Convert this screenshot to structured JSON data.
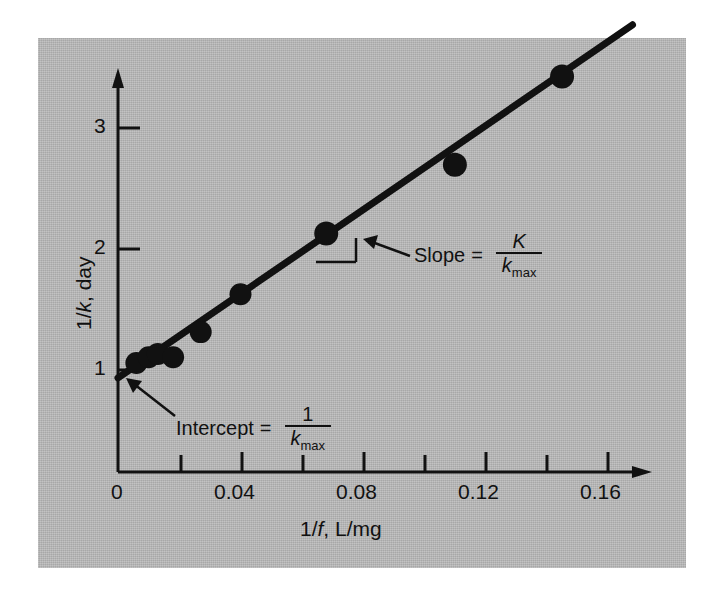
{
  "figure": {
    "background_color": "#ffffff",
    "panel_color": "#b6b6b6",
    "ink_color": "#111111"
  },
  "axes": {
    "x": {
      "title_parts": {
        "prefix": "1/",
        "italic": "f",
        "suffix": ", L/mg"
      },
      "title_plain": "1/f, L/mg",
      "major_ticks": [
        0,
        0.04,
        0.08,
        0.12,
        0.16
      ],
      "major_tick_labels": [
        "0",
        "0.04",
        "0.08",
        "0.12",
        "0.16"
      ],
      "minor_ticks": [
        0.02,
        0.06,
        0.1,
        0.14
      ],
      "range": [
        0,
        0.172
      ]
    },
    "y": {
      "title_parts": {
        "prefix": "1/",
        "italic": "k",
        "suffix": ", day"
      },
      "title_plain": "1/k, day",
      "major_ticks": [
        1,
        2,
        3
      ],
      "major_tick_labels": [
        "1",
        "2",
        "3"
      ],
      "range": [
        0,
        3.75
      ]
    }
  },
  "annotations": {
    "slope": {
      "label": "Slope",
      "equals": "=",
      "numerator": "K",
      "denominator_base": "k",
      "denominator_sub": "max",
      "plain": "Slope = K / k_max"
    },
    "intercept": {
      "label": "Intercept",
      "equals": "=",
      "numerator": "1",
      "denominator_base": "k",
      "denominator_sub": "max",
      "plain": "Intercept = 1 / k_max"
    }
  },
  "chart_data": {
    "type": "scatter",
    "title": "",
    "subtitle": "",
    "xlabel": "1/f, L/mg",
    "ylabel": "1/k, day",
    "xlim": [
      0,
      0.172
    ],
    "ylim": [
      0,
      3.75
    ],
    "grid": false,
    "legend": null,
    "xticks": [
      0,
      0.02,
      0.04,
      0.06,
      0.08,
      0.1,
      0.12,
      0.14,
      0.16
    ],
    "xticklabels": [
      "0",
      "",
      "0.04",
      "",
      "0.08",
      "",
      "0.12",
      "",
      "0.16"
    ],
    "yticks": [
      1,
      2,
      3
    ],
    "yticklabels": [
      "1",
      "2",
      "3"
    ],
    "series": [
      {
        "name": "observations",
        "marker": "filled-circle",
        "marker_color": "#111111",
        "x": [
          0.006,
          0.01,
          0.013,
          0.018,
          0.027,
          0.04,
          0.068,
          0.11,
          0.145
        ],
        "y": [
          0.95,
          1.0,
          1.03,
          1.0,
          1.22,
          1.55,
          2.08,
          2.68,
          3.45
        ]
      },
      {
        "name": "least-squares fit",
        "type": "line",
        "color": "#111111",
        "intercept": 0.82,
        "slope": 18.3,
        "x_start": 0.0,
        "x_end": 0.168,
        "y_start": 0.82,
        "y_end": 3.9
      }
    ],
    "annotations": [
      {
        "text": "Slope = K / k_max",
        "points_to": "fit-line",
        "at_x": 0.073,
        "at_y": 2.0
      },
      {
        "text": "Intercept = 1 / k_max",
        "points_to": "y-intercept",
        "at_x": 0.0,
        "at_y": 0.82
      }
    ]
  }
}
